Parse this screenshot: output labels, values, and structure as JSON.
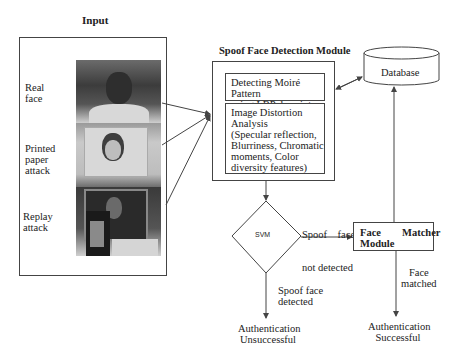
{
  "diagram": {
    "input": {
      "title": "Input",
      "items": [
        {
          "label_line1": "Real",
          "label_line2": "face",
          "label_line3": ""
        },
        {
          "label_line1": "Printed",
          "label_line2": "paper",
          "label_line3": "attack"
        },
        {
          "label_line1": "Replay",
          "label_line2": "attack",
          "label_line3": ""
        }
      ]
    },
    "spoof_module": {
      "title": "Spoof Face Detection Module",
      "moire": {
        "line1": "Detecting Moiré Pattern",
        "line2": "using LBP descriptor"
      },
      "distortion": {
        "line1": "Image Distortion",
        "line2": "Analysis",
        "line3": "(Specular reflection,",
        "line4": "Blurriness, Chromatic",
        "line5": "moments, Color",
        "line6": "diversity features)"
      }
    },
    "database": {
      "label": "Database"
    },
    "svm": {
      "label": "SVM"
    },
    "face_matcher": {
      "line1": "Face        Matcher",
      "line2": "Module"
    },
    "edges": {
      "not_detected": {
        "line1": "Spoof    face",
        "line2": "not detected"
      },
      "detected": {
        "line1": "Spoof face",
        "line2": "detected"
      },
      "matched": {
        "line1": "Face",
        "line2": "matched"
      }
    },
    "outcomes": {
      "unsuccessful": {
        "line1": "Authentication",
        "line2": "Unsuccessful"
      },
      "successful": {
        "line1": "Authentication",
        "line2": "Successful"
      }
    },
    "colors": {
      "line": "#444444",
      "text": "#222222"
    }
  }
}
